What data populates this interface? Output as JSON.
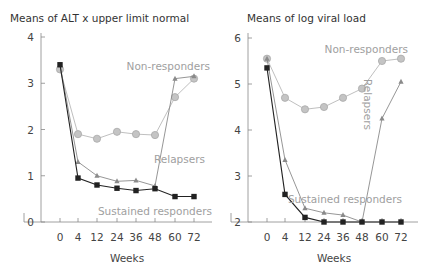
{
  "chart_data": [
    {
      "type": "line",
      "title": "Means of ALT x upper limit normal",
      "xlabel": "Weeks",
      "ylabel": "",
      "x": [
        0,
        4,
        12,
        24,
        36,
        48,
        60,
        72
      ],
      "x_tick_labels": [
        "0",
        "4",
        "12",
        "24",
        "36",
        "48",
        "60",
        "72"
      ],
      "y_tick_labels": [
        "0",
        "1",
        "2",
        "3",
        "4"
      ],
      "y_ticks": [
        0,
        1,
        2,
        3,
        4
      ],
      "ylim": [
        0,
        4
      ],
      "grid": false,
      "series": [
        {
          "name": "Non-responders",
          "marker": "circle",
          "color": "#b8b8b8",
          "values": [
            3.3,
            1.9,
            1.8,
            1.95,
            1.9,
            1.88,
            2.7,
            3.1
          ]
        },
        {
          "name": "Relapsers",
          "marker": "triangle",
          "color": "#8a8a8a",
          "values": [
            3.4,
            1.3,
            1.0,
            0.88,
            0.9,
            0.78,
            3.1,
            3.15
          ]
        },
        {
          "name": "Sustained responders",
          "marker": "square",
          "color": "#222222",
          "values": [
            3.4,
            0.95,
            0.8,
            0.73,
            0.68,
            0.72,
            0.55,
            0.55
          ]
        }
      ],
      "annotations": [
        "Non-responders",
        "Relapsers",
        "Sustained responders"
      ]
    },
    {
      "type": "line",
      "title": "Means of log viral load",
      "xlabel": "Weeks",
      "ylabel": "",
      "x": [
        0,
        4,
        12,
        24,
        36,
        48,
        60,
        72
      ],
      "x_tick_labels": [
        "0",
        "4",
        "12",
        "24",
        "36",
        "48",
        "60",
        "72"
      ],
      "y_tick_labels": [
        "2",
        "3",
        "4",
        "5",
        "6"
      ],
      "y_ticks": [
        2,
        3,
        4,
        5,
        6
      ],
      "ylim": [
        2,
        6
      ],
      "grid": false,
      "series": [
        {
          "name": "Non-responders",
          "marker": "circle",
          "color": "#b8b8b8",
          "values": [
            5.55,
            4.7,
            4.45,
            4.5,
            4.7,
            4.9,
            5.5,
            5.55
          ]
        },
        {
          "name": "Relapsers",
          "marker": "triangle",
          "color": "#8a8a8a",
          "values": [
            5.55,
            3.35,
            2.3,
            2.2,
            2.15,
            2.0,
            4.25,
            5.05
          ]
        },
        {
          "name": "Sustained responders",
          "marker": "square",
          "color": "#222222",
          "values": [
            5.35,
            2.6,
            2.1,
            2.0,
            2.0,
            2.0,
            2.0,
            2.0
          ]
        }
      ],
      "annotations": [
        "Non-responders",
        "Relapsers",
        "Sustained responders"
      ]
    }
  ]
}
